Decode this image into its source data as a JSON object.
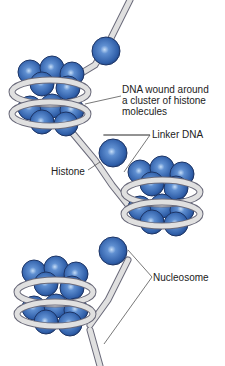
{
  "diagram": {
    "labels": {
      "dna_wound": [
        "DNA wound around",
        "a cluster of histone",
        "molecules"
      ],
      "linker_dna": "Linker DNA",
      "histone": "Histone",
      "nucleosome": "Nucleosome"
    },
    "colors": {
      "histone": "#3a6bb3",
      "histone_highlight": "#9cc0ee",
      "dna": "#d9d9d9",
      "dna_outline": "#6a6a7a",
      "leader_line": "#555555"
    }
  }
}
